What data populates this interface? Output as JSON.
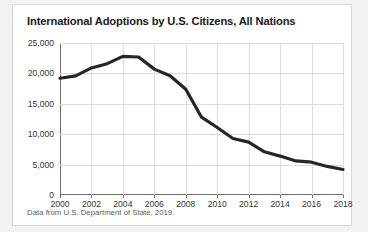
{
  "card": {
    "title": "International Adoptions by U.S. Citizens, All Nations",
    "source_note": "Data from U.S. Department of State, 2019."
  },
  "colors": {
    "line": "#262626",
    "grid": "#dcdcdc",
    "axis": "#6e6e6e",
    "title_text": "#1a1a1a",
    "tick_text": "#333333",
    "note_text": "#5a5a5a",
    "card_background": "#ffffff",
    "page_background": "#f2f2f2"
  },
  "chart_data": {
    "type": "line",
    "title": "International Adoptions by U.S. Citizens, All Nations",
    "xlabel": "",
    "ylabel": "",
    "xlim": [
      2000,
      2018
    ],
    "ylim": [
      0,
      25000
    ],
    "grid": true,
    "legend": false,
    "ytick_labels": [
      "0",
      "5,000",
      "10,000",
      "15,000",
      "20,000",
      "25,000"
    ],
    "ytick_values": [
      0,
      5000,
      10000,
      15000,
      20000,
      25000
    ],
    "xtick_labels": [
      "2000",
      "2002",
      "2004",
      "2006",
      "2008",
      "2010",
      "2012",
      "2014",
      "2016",
      "2018"
    ],
    "xtick_values": [
      2000,
      2002,
      2004,
      2006,
      2008,
      2010,
      2012,
      2014,
      2016,
      2018
    ],
    "x": [
      2000,
      2001,
      2002,
      2003,
      2004,
      2005,
      2006,
      2007,
      2008,
      2009,
      2010,
      2011,
      2012,
      2013,
      2014,
      2015,
      2016,
      2017,
      2018
    ],
    "values": [
      19200,
      19600,
      20900,
      21600,
      22800,
      22700,
      20700,
      19600,
      17400,
      12800,
      11100,
      9300,
      8700,
      7100,
      6400,
      5600,
      5400,
      4700,
      4200
    ],
    "series": [
      {
        "name": "International adoptions",
        "values": [
          19200,
          19600,
          20900,
          21600,
          22800,
          22700,
          20700,
          19600,
          17400,
          12800,
          11100,
          9300,
          8700,
          7100,
          6400,
          5600,
          5400,
          4700,
          4200
        ]
      }
    ]
  }
}
